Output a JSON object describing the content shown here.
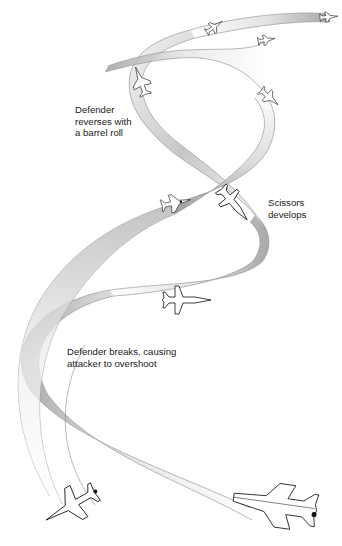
{
  "diagram": {
    "colors": {
      "background": "#ffffff",
      "ribbon_light": "#ffffff",
      "ribbon_mid": "#d8d8d8",
      "ribbon_dark": "#9e9e9e",
      "edge_line": "#9a9a9a",
      "text": "#1a1a1a",
      "aircraft_outline": "#111111"
    },
    "annotations": [
      {
        "id": "barrel-roll",
        "text": "Defender\nreverses with\na barrel roll",
        "x": 75,
        "y": 108
      },
      {
        "id": "scissors",
        "text": "Scissors\ndevelops",
        "x": 268,
        "y": 198
      },
      {
        "id": "break",
        "text": "Defender breaks, causing\nattacker to overshoot",
        "x": 67,
        "y": 347
      }
    ],
    "aircraft": [
      {
        "id": "attacker-start",
        "role": "attacker",
        "x": 45,
        "y": 500,
        "heading": "upper-left"
      },
      {
        "id": "defender-start",
        "role": "defender",
        "x": 265,
        "y": 510,
        "heading": "left"
      },
      {
        "id": "defender-break",
        "role": "defender",
        "x": 185,
        "y": 300,
        "heading": "right"
      },
      {
        "id": "attacker-scissors",
        "role": "attacker",
        "x": 175,
        "y": 203,
        "heading": "right"
      },
      {
        "id": "defender-scissors",
        "role": "defender",
        "x": 232,
        "y": 202,
        "heading": "lower-right"
      },
      {
        "id": "defender-roll",
        "role": "defender",
        "x": 140,
        "y": 80,
        "heading": "up"
      },
      {
        "id": "attacker-upper",
        "role": "attacker",
        "x": 268,
        "y": 97,
        "heading": "down-right"
      },
      {
        "id": "attacker-top",
        "role": "attacker",
        "x": 214,
        "y": 27,
        "heading": "upper-right"
      },
      {
        "id": "defender-top-mid",
        "role": "defender",
        "x": 264,
        "y": 40,
        "heading": "right"
      },
      {
        "id": "defender-top-end",
        "role": "defender",
        "x": 328,
        "y": 17,
        "heading": "right"
      }
    ]
  }
}
